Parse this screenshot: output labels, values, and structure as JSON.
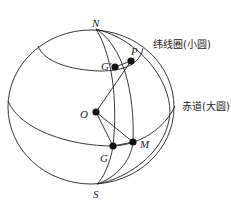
{
  "diagram": {
    "type": "spherical-geometry",
    "labels": {
      "north_pole": "N",
      "south_pole": "S",
      "center": "O",
      "point_p": "P",
      "point_g_prime": "G'",
      "point_g": "G",
      "point_m": "M",
      "latitude_circle": "纬线圈(小圆)",
      "equator": "赤道(大圆)"
    },
    "points": {
      "N": [
        96,
        29
      ],
      "S": [
        97,
        184
      ],
      "O": [
        96,
        112
      ],
      "P": [
        131,
        61
      ],
      "G_prime": [
        115,
        67
      ],
      "G": [
        113,
        146
      ],
      "M": [
        133,
        142
      ]
    },
    "colors": {
      "line": "#222222",
      "point": "#111111",
      "background": "#ffffff"
    }
  }
}
